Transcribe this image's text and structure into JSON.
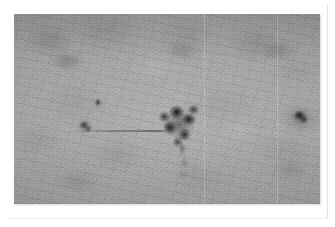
{
  "image": {
    "kind": "grayscale-photographic-plate",
    "caption": "",
    "alt_text": "Grayscale photographic plate showing several dark blob-like spots on a grainy gray field",
    "orientation": "landscape",
    "has_white_border": true,
    "plate": {
      "x": 14,
      "y": 14,
      "width": 306,
      "height": 190
    },
    "colors": {
      "page_background": "#ffffff",
      "plate_background": "#9b9b9b",
      "plate_highlight": "#a4a4a4",
      "plate_shadow": "#8f8f8f",
      "feature_dark": "#161616",
      "feature_mid": "#4a4a4a",
      "feature_faint": "#6e6e6e",
      "edge_line": "#e2e2e2"
    },
    "features": [
      {
        "name": "central-blob",
        "label": "Central dark cluster",
        "center_x": 166,
        "center_y": 110,
        "approx_width": 40,
        "approx_height": 44,
        "darkness": "very dark",
        "shape": "irregular lobed cluster"
      },
      {
        "name": "central-blob-tail",
        "label": "Tail below central cluster",
        "center_x": 170,
        "center_y": 149,
        "approx_width": 16,
        "approx_height": 38,
        "darkness": "faint",
        "shape": "vertical streak"
      },
      {
        "name": "right-blob",
        "label": "Right dark spot",
        "center_x": 286,
        "center_y": 103,
        "approx_width": 20,
        "approx_height": 18,
        "darkness": "dark",
        "shape": "rounded"
      },
      {
        "name": "left-large-spot",
        "label": "Left medium spot",
        "center_x": 71,
        "center_y": 112,
        "approx_width": 16,
        "approx_height": 14,
        "darkness": "medium",
        "shape": "rounded"
      },
      {
        "name": "left-small-spot",
        "label": "Left small spot",
        "center_x": 84,
        "center_y": 89,
        "approx_width": 10,
        "approx_height": 10,
        "darkness": "medium",
        "shape": "small round"
      },
      {
        "name": "horizontal-streak",
        "label": "Faint horizontal streak",
        "center_x": 104,
        "center_y": 117,
        "approx_width": 100,
        "approx_height": 2,
        "darkness": "faint",
        "shape": "thin line"
      },
      {
        "name": "top-left-smudge",
        "label": "Upper-left diffuse smudge",
        "center_x": 53,
        "center_y": 47,
        "approx_width": 44,
        "approx_height": 24,
        "darkness": "faint",
        "shape": "diffuse"
      },
      {
        "name": "top-mid-smudge",
        "label": "Upper-middle diffuse smudge",
        "center_x": 168,
        "center_y": 37,
        "approx_width": 48,
        "approx_height": 26,
        "darkness": "very faint",
        "shape": "diffuse"
      },
      {
        "name": "top-right-smudge",
        "label": "Upper-right diffuse smudge",
        "center_x": 265,
        "center_y": 37,
        "approx_width": 50,
        "approx_height": 26,
        "darkness": "faint",
        "shape": "diffuse"
      },
      {
        "name": "bottom-right-smudge",
        "label": "Lower-right diffuse smudge",
        "center_x": 276,
        "center_y": 156,
        "approx_width": 52,
        "approx_height": 28,
        "darkness": "very faint",
        "shape": "diffuse"
      },
      {
        "name": "bottom-left-smudge",
        "label": "Lower-left diffuse smudge",
        "center_x": 63,
        "center_y": 167,
        "approx_width": 54,
        "approx_height": 30,
        "darkness": "very faint",
        "shape": "diffuse"
      }
    ]
  }
}
